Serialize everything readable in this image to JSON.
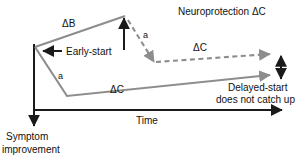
{
  "figure": {
    "type": "schematic-line-diagram",
    "colors": {
      "axis": "#1a1a1a",
      "curve_gray": "#8d8d8d",
      "dashed_gray": "#8d8d8d",
      "text": "#111111",
      "background": "#ffffff"
    },
    "axes": {
      "x_label": "Time",
      "y_label_line1": "Symptom",
      "y_label_line2": "improvement",
      "x_axis_direction": "right-arrow",
      "y_axis_direction": "down-arrow"
    },
    "annotations": {
      "delta_b": "ΔB",
      "early_start": "Early-start",
      "a_lower": "a",
      "a_upper": "a",
      "delta_c_lower": "ΔC",
      "delta_c_dashed": "ΔC",
      "neuroprotection": "Neuroprotection ΔC",
      "delayed_start_line1": "Delayed-start",
      "delayed_start_line2": "does not catch up"
    },
    "series": {
      "early_start_curve": {
        "description": "gray solid curve rising from origin to apex then implied",
        "points": [
          [
            35,
            47
          ],
          [
            125,
            16
          ]
        ]
      },
      "delayed_start_curve": {
        "description": "gray solid curve dipping to trough then rising slowly to right",
        "points": [
          [
            35,
            47
          ],
          [
            67,
            96
          ],
          [
            272,
            75
          ]
        ]
      },
      "projected_curve": {
        "description": "gray dashed curve descending from apex then rising slowly to right",
        "points": [
          [
            128,
            20
          ],
          [
            155,
            62
          ],
          [
            272,
            54
          ]
        ]
      }
    }
  }
}
